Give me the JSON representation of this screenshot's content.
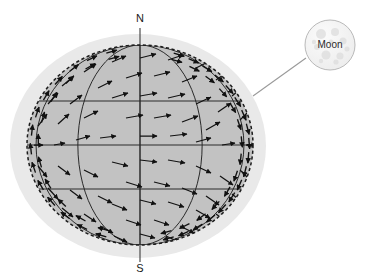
{
  "figure": {
    "background_color": "#ffffff"
  },
  "labels": {
    "north_pole": "N",
    "south_pole": "S",
    "callout": "Moon"
  },
  "colors": {
    "halo_fill": "#e9e9e9",
    "sphere_fill": "#c2c2c2",
    "sphere_outline": "#1c1c1c",
    "grid_line": "#2a2a2a",
    "arrow": "#111111",
    "axis_line": "#3c3c3c",
    "leader_line": "#9a9a9a",
    "moon_fill": "#f2f2f2",
    "moon_outline": "#b9b9b9",
    "moon_crater": "#dcdcdc"
  },
  "geometry": {
    "halo": {
      "cx": 138,
      "cy": 146,
      "rx": 128,
      "ry": 112
    },
    "sphere": {
      "cx": 140,
      "cy": 145,
      "rx": 113,
      "ry": 100
    },
    "axis": {
      "x": 140,
      "y_top": 28,
      "y_bottom": 262
    },
    "latitudes_y": [
      101,
      145,
      189
    ],
    "meridian_offsets": [
      -0.92,
      -0.55,
      0.0,
      0.55,
      0.92
    ],
    "moon": {
      "cx": 330,
      "cy": 45,
      "r": 25
    },
    "leader_line": {
      "x1": 253,
      "y1": 96,
      "x2": 306,
      "y2": 58
    }
  },
  "vector_field": {
    "description": "Tidal acceleration arrows drawn across the visible hemisphere",
    "arrow_count": 78,
    "arrows": [
      {
        "x": 140,
        "y": 58,
        "dx": 16,
        "dy": -4
      },
      {
        "x": 112,
        "y": 62,
        "dx": 14,
        "dy": -6
      },
      {
        "x": 168,
        "y": 60,
        "dx": 15,
        "dy": -5
      },
      {
        "x": 196,
        "y": 68,
        "dx": 14,
        "dy": -7
      },
      {
        "x": 84,
        "y": 72,
        "dx": 12,
        "dy": -8
      },
      {
        "x": 216,
        "y": 80,
        "dx": 13,
        "dy": -9
      },
      {
        "x": 62,
        "y": 86,
        "dx": 11,
        "dy": -9
      },
      {
        "x": 126,
        "y": 78,
        "dx": 16,
        "dy": -5
      },
      {
        "x": 154,
        "y": 76,
        "dx": 16,
        "dy": -4
      },
      {
        "x": 182,
        "y": 82,
        "dx": 15,
        "dy": -6
      },
      {
        "x": 98,
        "y": 88,
        "dx": 14,
        "dy": -7
      },
      {
        "x": 232,
        "y": 96,
        "dx": 12,
        "dy": -10
      },
      {
        "x": 48,
        "y": 104,
        "dx": 10,
        "dy": -11
      },
      {
        "x": 70,
        "y": 104,
        "dx": 12,
        "dy": -9
      },
      {
        "x": 140,
        "y": 96,
        "dx": 17,
        "dy": -3
      },
      {
        "x": 112,
        "y": 98,
        "dx": 16,
        "dy": -5
      },
      {
        "x": 168,
        "y": 98,
        "dx": 17,
        "dy": -4
      },
      {
        "x": 196,
        "y": 104,
        "dx": 15,
        "dy": -7
      },
      {
        "x": 218,
        "y": 112,
        "dx": 13,
        "dy": -9
      },
      {
        "x": 240,
        "y": 120,
        "dx": 11,
        "dy": -11
      },
      {
        "x": 38,
        "y": 126,
        "dx": 9,
        "dy": -12
      },
      {
        "x": 58,
        "y": 124,
        "dx": 11,
        "dy": -10
      },
      {
        "x": 84,
        "y": 118,
        "dx": 14,
        "dy": -7
      },
      {
        "x": 126,
        "y": 118,
        "dx": 17,
        "dy": -3
      },
      {
        "x": 154,
        "y": 118,
        "dx": 17,
        "dy": -3
      },
      {
        "x": 182,
        "y": 122,
        "dx": 16,
        "dy": -6
      },
      {
        "x": 206,
        "y": 130,
        "dx": 14,
        "dy": -8
      },
      {
        "x": 246,
        "y": 145,
        "dx": 10,
        "dy": 0
      },
      {
        "x": 34,
        "y": 145,
        "dx": 9,
        "dy": 0
      },
      {
        "x": 54,
        "y": 145,
        "dx": 11,
        "dy": -2
      },
      {
        "x": 76,
        "y": 140,
        "dx": 14,
        "dy": -4
      },
      {
        "x": 100,
        "y": 138,
        "dx": 16,
        "dy": -2
      },
      {
        "x": 140,
        "y": 136,
        "dx": 17,
        "dy": 0
      },
      {
        "x": 170,
        "y": 136,
        "dx": 17,
        "dy": -2
      },
      {
        "x": 196,
        "y": 142,
        "dx": 15,
        "dy": -4
      },
      {
        "x": 222,
        "y": 145,
        "dx": 13,
        "dy": -2
      },
      {
        "x": 38,
        "y": 166,
        "dx": 9,
        "dy": 11
      },
      {
        "x": 58,
        "y": 166,
        "dx": 12,
        "dy": 9
      },
      {
        "x": 84,
        "y": 170,
        "dx": 14,
        "dy": 7
      },
      {
        "x": 112,
        "y": 162,
        "dx": 16,
        "dy": 4
      },
      {
        "x": 140,
        "y": 160,
        "dx": 17,
        "dy": 2
      },
      {
        "x": 168,
        "y": 160,
        "dx": 17,
        "dy": 3
      },
      {
        "x": 196,
        "y": 166,
        "dx": 15,
        "dy": 7
      },
      {
        "x": 220,
        "y": 176,
        "dx": 13,
        "dy": 9
      },
      {
        "x": 240,
        "y": 170,
        "dx": 11,
        "dy": 11
      },
      {
        "x": 48,
        "y": 188,
        "dx": 10,
        "dy": 11
      },
      {
        "x": 70,
        "y": 190,
        "dx": 12,
        "dy": 9
      },
      {
        "x": 98,
        "y": 196,
        "dx": 14,
        "dy": 7
      },
      {
        "x": 126,
        "y": 182,
        "dx": 16,
        "dy": 5
      },
      {
        "x": 154,
        "y": 182,
        "dx": 16,
        "dy": 4
      },
      {
        "x": 182,
        "y": 188,
        "dx": 15,
        "dy": 6
      },
      {
        "x": 206,
        "y": 196,
        "dx": 13,
        "dy": 9
      },
      {
        "x": 232,
        "y": 194,
        "dx": 12,
        "dy": 10
      },
      {
        "x": 62,
        "y": 208,
        "dx": 11,
        "dy": 9
      },
      {
        "x": 84,
        "y": 214,
        "dx": 12,
        "dy": 8
      },
      {
        "x": 112,
        "y": 204,
        "dx": 15,
        "dy": 6
      },
      {
        "x": 140,
        "y": 200,
        "dx": 16,
        "dy": 4
      },
      {
        "x": 168,
        "y": 202,
        "dx": 16,
        "dy": 5
      },
      {
        "x": 196,
        "y": 210,
        "dx": 14,
        "dy": 8
      },
      {
        "x": 216,
        "y": 214,
        "dx": 12,
        "dy": 9
      },
      {
        "x": 100,
        "y": 226,
        "dx": 13,
        "dy": 7
      },
      {
        "x": 126,
        "y": 220,
        "dx": 15,
        "dy": 5
      },
      {
        "x": 154,
        "y": 220,
        "dx": 15,
        "dy": 5
      },
      {
        "x": 180,
        "y": 226,
        "dx": 14,
        "dy": 7
      },
      {
        "x": 140,
        "y": 234,
        "dx": 15,
        "dy": 4
      },
      {
        "x": 114,
        "y": 236,
        "dx": 13,
        "dy": 6
      },
      {
        "x": 166,
        "y": 236,
        "dx": 13,
        "dy": 6
      }
    ]
  },
  "limb_arrows": {
    "description": "Dense arrow band following the right and left limb of the sphere",
    "right_band_count": 18,
    "left_band_count": 14
  }
}
